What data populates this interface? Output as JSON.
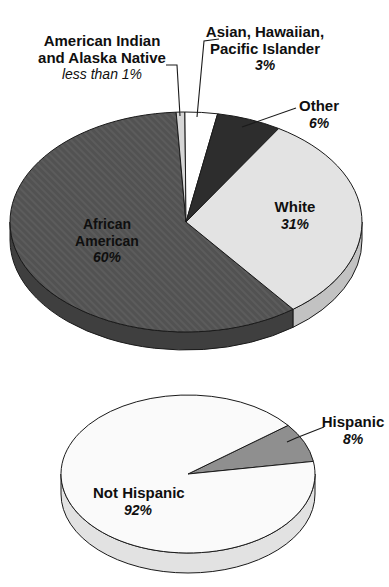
{
  "figure": {
    "background": "#ffffff"
  },
  "colors": {
    "outline": "#1a1a1a",
    "leader_line": "#1a1a1a",
    "text": "#0f0f0f"
  },
  "chart_data": [
    {
      "type": "pie",
      "id": "race",
      "style": "3d",
      "title": "",
      "legend": "none",
      "start_angle": 142.5,
      "slices": [
        {
          "label": "African American",
          "pct_label": "60%",
          "value": 60,
          "color": "#525252",
          "side_color": "#3f3f3f",
          "texture": "hatch"
        },
        {
          "label": "American Indian and Alaska Native",
          "pct_label": "less than 1%",
          "value": 0.8,
          "color": "#d6d6d6",
          "side_color": "#bdbdbd"
        },
        {
          "label": "Asian, Hawaiian, Pacific Islander",
          "pct_label": "3%",
          "value": 3,
          "color": "#ffffff",
          "side_color": "#e8e8e8"
        },
        {
          "label": "Other",
          "pct_label": "6%",
          "value": 6,
          "color": "#2d2d2d",
          "side_color": "#212121"
        },
        {
          "label": "White",
          "pct_label": "31%",
          "value": 31,
          "color": "#e3e3e3",
          "side_color": "#c2c2c2"
        }
      ]
    },
    {
      "type": "pie",
      "id": "ethnicity",
      "style": "3d",
      "title": "",
      "legend": "none",
      "start_angle": 52,
      "slices": [
        {
          "label": "Hispanic",
          "pct_label": "8%",
          "value": 8,
          "color": "#8f8f8f",
          "side_color": "#797979"
        },
        {
          "label": "Not Hispanic",
          "pct_label": "92%",
          "value": 92,
          "color": "#fafafa",
          "side_color": "#e2e2e2"
        }
      ]
    }
  ],
  "callouts": {
    "race": {
      "american_indian": {
        "lines": [
          "American Indian",
          "and Alaska Native"
        ],
        "pct": "less than 1%"
      },
      "asian": {
        "lines": [
          "Asian, Hawaiian,",
          "Pacific Islander"
        ],
        "pct": "3%"
      },
      "other": {
        "lines": [
          "Other"
        ],
        "pct": "6%"
      },
      "white": {
        "lines": [
          "White"
        ],
        "pct": "31%"
      },
      "african_american": {
        "lines": [
          "African",
          "American"
        ],
        "pct": "60%"
      }
    },
    "ethnicity": {
      "hispanic": {
        "lines": [
          "Hispanic"
        ],
        "pct": "8%"
      },
      "not_hispanic": {
        "lines": [
          "Not Hispanic"
        ],
        "pct": "92%"
      }
    }
  }
}
